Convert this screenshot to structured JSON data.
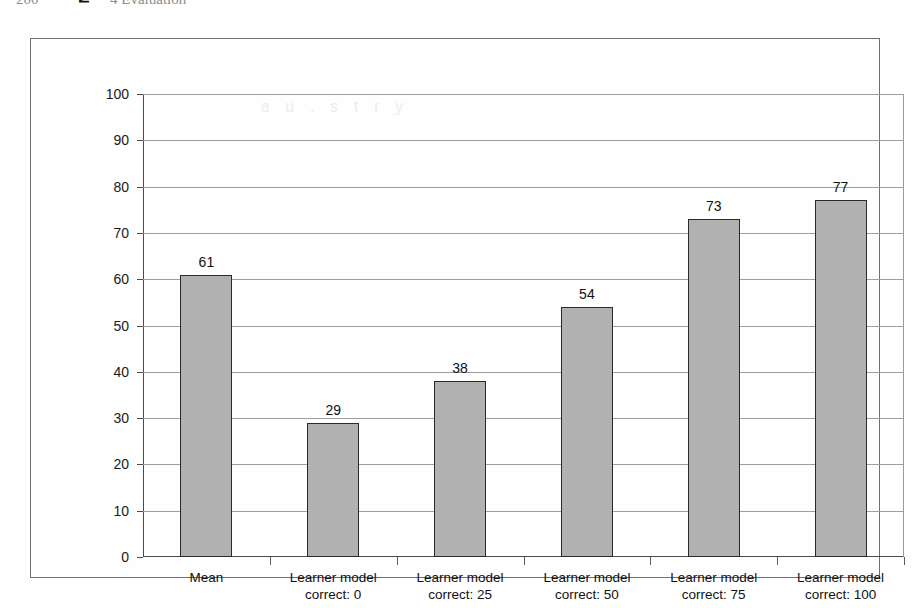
{
  "page": {
    "header_number": "200",
    "header_chapter": "4 Evaluation",
    "bleed_artifact": "a u . s t r y"
  },
  "chart_data": {
    "type": "bar",
    "title": "",
    "xlabel": "",
    "ylabel": "Mean agreement (5 pt % scale)",
    "categories": [
      "Mean",
      "Learner model\ncorrect: 0",
      "Learner model\ncorrect: 25",
      "Learner model\ncorrect: 50",
      "Learner model\ncorrect: 75",
      "Learner model\ncorrect: 100"
    ],
    "category_lines": [
      [
        "Mean",
        ""
      ],
      [
        "Learner model",
        "correct: 0"
      ],
      [
        "Learner model",
        "correct: 25"
      ],
      [
        "Learner model",
        "correct: 50"
      ],
      [
        "Learner model",
        "correct: 75"
      ],
      [
        "Learner model",
        "correct: 100"
      ]
    ],
    "values": [
      61,
      29,
      38,
      54,
      73,
      77
    ],
    "value_labels": [
      "61",
      "29",
      "38",
      "54",
      "73",
      "77"
    ],
    "ylim": [
      0,
      100
    ],
    "ytick_labels": [
      "100",
      "90",
      "80",
      "70",
      "60",
      "50",
      "40",
      "30",
      "20",
      "10",
      "0"
    ],
    "ytick_values": [
      100,
      90,
      80,
      70,
      60,
      50,
      40,
      30,
      20,
      10,
      0
    ],
    "grid": true,
    "legend": "none",
    "colors": {
      "bar_fill": "#b1b1b1",
      "bar_border": "#2a2a2a",
      "gridline": "#9d9d9d",
      "axis": "#4a4a4a",
      "frame": "#6f6f6f",
      "text": "#111111",
      "background": "#fefefe"
    }
  }
}
